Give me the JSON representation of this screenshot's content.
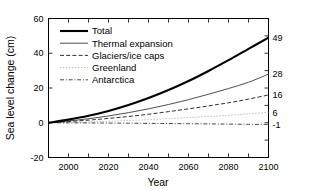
{
  "chart_data": {
    "type": "line",
    "title": "",
    "xlabel": "Year",
    "ylabel": "Sea level change (cm)",
    "xlim": [
      1990,
      2100
    ],
    "ylim": [
      -20,
      60
    ],
    "xticks": [
      2000,
      2020,
      2040,
      2060,
      2080,
      2100
    ],
    "xtick_labels": [
      "2000",
      "2020",
      "2040",
      "2060",
      "2080",
      "2100"
    ],
    "yticks": [
      -20,
      0,
      20,
      40,
      60
    ],
    "ytick_labels": [
      "-20",
      "0",
      "20",
      "40",
      "60"
    ],
    "minor_xtick_interval": 10,
    "grid": false,
    "legend_position": "upper left",
    "right_axis_labels": [
      {
        "label": "49",
        "value": 49,
        "series": "Total"
      },
      {
        "label": "28",
        "value": 28,
        "series": "Thermal expansion"
      },
      {
        "label": "16",
        "value": 16,
        "series": "Glaciers/ice caps"
      },
      {
        "label": "6",
        "value": 6,
        "series": "Greenland"
      },
      {
        "label": "-1",
        "value": -1,
        "series": "Antarctica"
      }
    ],
    "x": [
      1990,
      2000,
      2010,
      2020,
      2030,
      2040,
      2050,
      2060,
      2070,
      2080,
      2090,
      2100
    ],
    "series": [
      {
        "name": "Total",
        "style": "solid",
        "width": "thick",
        "color": "#000000",
        "values": [
          0,
          1.8,
          4.0,
          6.8,
          10.2,
          14.2,
          18.8,
          24.0,
          29.8,
          36.0,
          42.5,
          49.0
        ]
      },
      {
        "name": "Thermal expansion",
        "style": "solid",
        "width": "thin",
        "color": "#3a3a3a",
        "values": [
          0,
          1.0,
          2.3,
          3.9,
          5.8,
          8.0,
          10.5,
          13.3,
          16.4,
          19.7,
          23.3,
          28.0
        ]
      },
      {
        "name": "Glaciers/ice caps",
        "style": "dashed",
        "width": "thin",
        "color": "#1a1a1a",
        "values": [
          0,
          0.7,
          1.5,
          2.5,
          3.6,
          4.9,
          6.4,
          8.0,
          9.7,
          11.5,
          13.6,
          16.0
        ]
      },
      {
        "name": "Greenland",
        "style": "dotted",
        "width": "thin",
        "color": "#b5b5b5",
        "values": [
          0,
          0.2,
          0.5,
          0.9,
          1.3,
          1.8,
          2.4,
          3.0,
          3.6,
          4.3,
          5.1,
          6.0
        ]
      },
      {
        "name": "Antarctica",
        "style": "dashdot",
        "width": "thin",
        "color": "#333333",
        "values": [
          0,
          -0.05,
          -0.1,
          -0.18,
          -0.26,
          -0.35,
          -0.45,
          -0.55,
          -0.66,
          -0.78,
          -0.89,
          -1.0
        ]
      }
    ]
  }
}
